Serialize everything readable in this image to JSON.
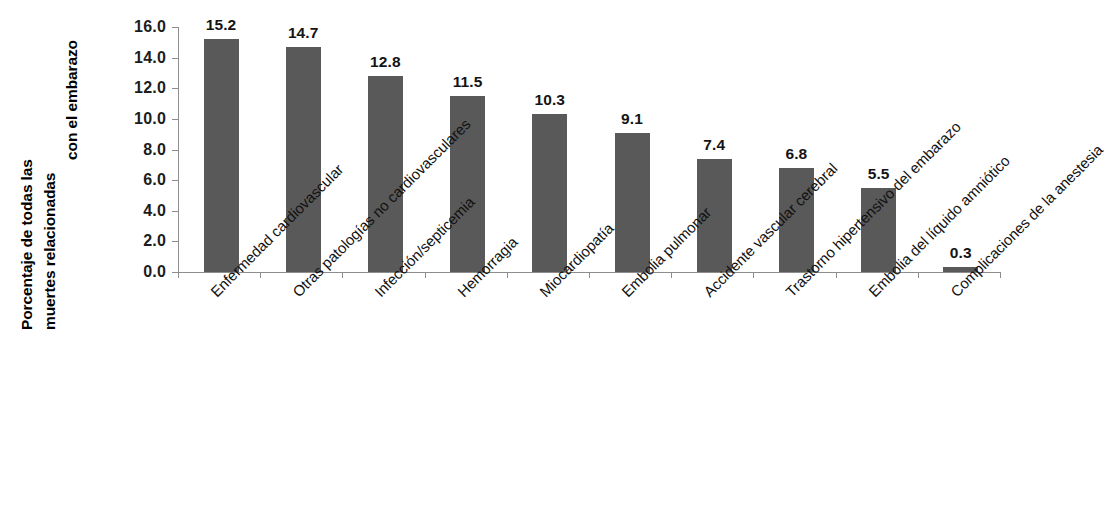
{
  "chart_data": {
    "type": "bar",
    "title": "",
    "xlabel": "",
    "ylabel": "Porcentaje de todas las muertes relacionadas con el embarazo",
    "ylabel_lines": [
      "Porcentaje de todas las",
      "muertes relacionadas",
      "con el embarazo"
    ],
    "ylim": [
      0.0,
      16.0
    ],
    "ytick_labels": [
      "16.0",
      "14.0",
      "12.0",
      "10.0",
      "8.0",
      "6.0",
      "4.0",
      "2.0",
      "0.0"
    ],
    "ytick_values": [
      16.0,
      14.0,
      12.0,
      10.0,
      8.0,
      6.0,
      4.0,
      2.0,
      0.0
    ],
    "grid": false,
    "legend": false,
    "bar_color": "#595959",
    "axis_color": "#8d8d8d",
    "categories": [
      "Enfermedad cardiovascular",
      "Otras patologías no cardiovasculares",
      "Infección/septicemia",
      "Hemorragia",
      "Miocardiopatía",
      "Embolia pulmonar",
      "Accidente vascular cerebral",
      "Trastorno hipertensivo del embarazo",
      "Embolia del líquido amniótico",
      "Complicaciones de la anestesia"
    ],
    "values": [
      15.2,
      14.7,
      12.8,
      11.5,
      10.3,
      9.1,
      7.4,
      6.8,
      5.5,
      0.3
    ],
    "value_labels": [
      "15.2",
      "14.7",
      "12.8",
      "11.5",
      "10.3",
      "9.1",
      "7.4",
      "6.8",
      "5.5",
      "0.3"
    ]
  }
}
